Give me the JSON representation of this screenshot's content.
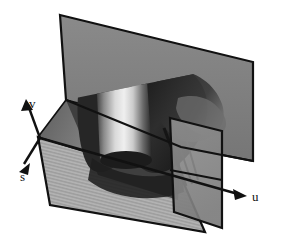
{
  "figure": {
    "background_color": "#ffffff",
    "width": 281,
    "height": 246,
    "rendering": "grayscale shaded surface plot"
  },
  "axes": {
    "origin": {
      "x": 40,
      "y": 138
    },
    "items": [
      {
        "id": "v",
        "label": "v",
        "direction": "up-right",
        "tip": {
          "x": 27,
          "y": 101
        },
        "label_position": {
          "x": 29,
          "y": 97
        }
      },
      {
        "id": "s",
        "label": "s",
        "direction": "down-left",
        "tip": {
          "x": 19,
          "y": 170
        },
        "label_position": {
          "x": 20,
          "y": 170
        }
      },
      {
        "id": "u",
        "label": "u",
        "direction": "right-down",
        "tip": {
          "x": 246,
          "y": 196
        },
        "label_position": {
          "x": 252,
          "y": 190
        }
      }
    ],
    "line_color": "#111111",
    "line_width": 2
  },
  "planes": [
    {
      "name": "back-plane",
      "orientation": "vertical back wall",
      "fill_color": "#808080",
      "edge_color": "#111111",
      "points": "60,15 253,62 253,160 181,147 66,100"
    },
    {
      "name": "floor-plane",
      "orientation": "horizontal ground",
      "fill_color": "#aeaeae",
      "edge_color": "#111111",
      "shading": "horizontal stripes",
      "points": "38,137 170,177 205,232 50,205"
    },
    {
      "name": "right-cutting-plane",
      "orientation": "vertical cross-section",
      "fill_color": "#8c8c8c",
      "edge_color": "#111111",
      "points": "170,118 222,131 222,228 175,213"
    },
    {
      "name": "left-side-plane",
      "orientation": "vertical left wall",
      "fill_color": "#6e6e6e",
      "edge_color": "#111111",
      "points": "38,137 66,100 120,115 98,160"
    }
  ],
  "objects": [
    {
      "name": "central-vortex-cylinder",
      "description": "bright shaded cylindrical vortex core",
      "highlight_color": "#e8e8e8",
      "shadow_color": "#2a2a2a"
    },
    {
      "name": "dark-swirl-structure",
      "description": "dark recirculation / breakdown bubble region",
      "color": "#1e1e1e"
    },
    {
      "name": "secondary-vortex-lobe",
      "description": "dark lobed structure to the right of the core",
      "color": "#2c2c2c"
    }
  ],
  "colors": {
    "background": "#ffffff",
    "outline": "#111111",
    "back_plane": "#808080",
    "floor_plane": "#aeaeae",
    "cut_plane": "#8c8c8c",
    "dark_structure": "#1e1e1e",
    "bright_highlight": "#ececec"
  }
}
